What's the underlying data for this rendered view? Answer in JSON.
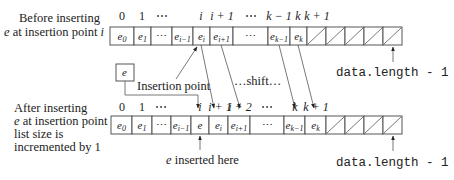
{
  "before": {
    "label_line1": "Before inserting",
    "label_line2_pre": "e",
    "label_line2_post": " at insertion point ",
    "label_line2_var": "i",
    "indices": [
      {
        "text": "0",
        "x": 122
      },
      {
        "text": "1",
        "x": 142
      },
      {
        "text": "⋯",
        "x": 162
      },
      {
        "text": "i",
        "x": 201,
        "italic": true
      },
      {
        "text": "i + 1",
        "x": 222,
        "italic": true
      },
      {
        "text": "⋯",
        "x": 251
      },
      {
        "text": "k − 1",
        "x": 279,
        "italic": true
      },
      {
        "text": "k",
        "x": 298,
        "italic": true
      },
      {
        "text": "k + 1",
        "x": 317,
        "italic": true
      }
    ],
    "cells": [
      {
        "x": 110,
        "w": 24,
        "base": "e",
        "sub": "0"
      },
      {
        "x": 134,
        "w": 17,
        "base": "e",
        "sub": "1"
      },
      {
        "x": 151,
        "w": 21,
        "base": "⋯",
        "sub": ""
      },
      {
        "x": 172,
        "w": 21,
        "base": "e",
        "sub": "i−1"
      },
      {
        "x": 193,
        "w": 17,
        "base": "e",
        "sub": "i"
      },
      {
        "x": 210,
        "w": 23,
        "base": "e",
        "sub": "i+1"
      },
      {
        "x": 233,
        "w": 35,
        "base": "⋯",
        "sub": ""
      },
      {
        "x": 268,
        "w": 22,
        "base": "e",
        "sub": "k−1"
      },
      {
        "x": 290,
        "w": 17,
        "base": "e",
        "sub": "k"
      }
    ],
    "empty_cells": [
      307,
      326,
      345,
      364,
      383
    ],
    "empty_cell_width": 19,
    "row_y": 27,
    "row_h": 18,
    "capacity_label": "data.length - 1"
  },
  "insert": {
    "element_label": "e",
    "insertion_point_label": "Insertion point",
    "shift_label": "…shift…"
  },
  "after": {
    "label_line1": "After inserting",
    "label_line2_pre": "e",
    "label_line2_post": " at insertion point ",
    "label_line2_var": "i,",
    "label_line3": "list size is",
    "label_line4": "incremented by 1",
    "indices": [
      {
        "text": "0",
        "x": 122
      },
      {
        "text": "1",
        "x": 142
      },
      {
        "text": "⋯",
        "x": 161
      },
      {
        "text": "i",
        "x": 200,
        "italic": true
      },
      {
        "text": "i + 1",
        "x": 220,
        "italic": true
      },
      {
        "text": "i + 2",
        "x": 240,
        "italic": true
      },
      {
        "text": "⋯",
        "x": 267
      },
      {
        "text": "k",
        "x": 295,
        "italic": true
      },
      {
        "text": "k + 1",
        "x": 316,
        "italic": true
      }
    ],
    "cells": [
      {
        "x": 111,
        "w": 21,
        "base": "e",
        "sub": "0"
      },
      {
        "x": 132,
        "w": 20,
        "base": "e",
        "sub": "1"
      },
      {
        "x": 152,
        "w": 19,
        "base": "⋯",
        "sub": ""
      },
      {
        "x": 171,
        "w": 20,
        "base": "e",
        "sub": "i−1"
      },
      {
        "x": 191,
        "w": 18,
        "base": "e",
        "sub": ""
      },
      {
        "x": 209,
        "w": 19,
        "base": "e",
        "sub": "i"
      },
      {
        "x": 228,
        "w": 22,
        "base": "e",
        "sub": "i+1"
      },
      {
        "x": 250,
        "w": 34,
        "base": "⋯",
        "sub": ""
      },
      {
        "x": 284,
        "w": 21,
        "base": "e",
        "sub": "k−1"
      },
      {
        "x": 305,
        "w": 21,
        "base": "e",
        "sub": "k"
      }
    ],
    "empty_cells": [
      326,
      345,
      364,
      383
    ],
    "empty_cell_width": 19,
    "row_y": 116,
    "row_h": 18,
    "inserted_label": "e inserted here",
    "capacity_label": "data.length - 1"
  }
}
